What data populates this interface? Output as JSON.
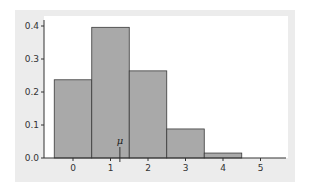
{
  "chart_data": {
    "type": "bar",
    "title": "",
    "xlabel": "",
    "ylabel": "",
    "categories": [
      "0",
      "1",
      "2",
      "3",
      "4",
      "5"
    ],
    "values": [
      0.237,
      0.396,
      0.264,
      0.088,
      0.015,
      0.001
    ],
    "ylim": [
      0,
      0.42
    ],
    "xlim": [
      -0.5,
      5.6
    ],
    "yticks": [
      0.0,
      0.1,
      0.2,
      0.3,
      0.4
    ],
    "ytick_labels": [
      "0.0",
      "0.1",
      "0.2",
      "0.3",
      "0.4"
    ],
    "xticks": [
      0,
      1,
      2,
      3,
      4,
      5
    ],
    "xtick_labels": [
      "0",
      "1",
      "2",
      "3",
      "4",
      "5"
    ],
    "grid": false,
    "legend": null,
    "annotations": [
      {
        "text": "μ",
        "x": 1.25,
        "description": "mean marker line on x-axis"
      }
    ],
    "bar_color": "#a9a9a9",
    "bar_edge_color": "#3a3a3a",
    "panel_color": "#ececec"
  },
  "labels": {
    "mu": "μ"
  }
}
